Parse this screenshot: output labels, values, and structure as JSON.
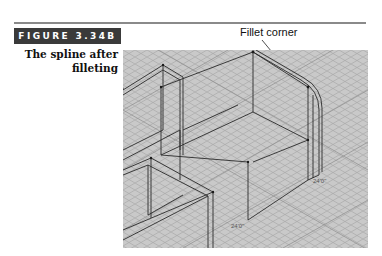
{
  "figure": {
    "label": "FIGURE 3.34B",
    "caption_line1": "The spline after",
    "caption_line2": "filleting",
    "callout": "Fillet corner"
  },
  "viewport": {
    "description": "Isometric wireframe CAD view with grid",
    "dimension_labels": [
      "24'0\"",
      "24'0\""
    ],
    "background_color": "#c8c8c8",
    "grid_color": "#a0a0a0",
    "line_color": "#2a2a2a"
  }
}
